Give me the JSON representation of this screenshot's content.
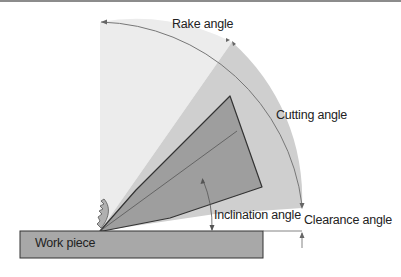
{
  "diagram": {
    "type": "cutting-tool-angles",
    "labels": {
      "rake_angle": "Rake angle",
      "cutting_angle": "Cutting angle",
      "inclination_angle": "Inclination angle",
      "clearance_angle": "Clearance angle",
      "work_piece": "Work piece"
    },
    "colors": {
      "top_rule": "#8c8c8c",
      "rake_sector": "#ececec",
      "cutting_sector": "#cfcfcf",
      "tool_body": "#9e9e9e",
      "work_piece": "#a8a8a8",
      "outline": "#333333",
      "arc_line": "#777777",
      "text": "#222222"
    }
  }
}
